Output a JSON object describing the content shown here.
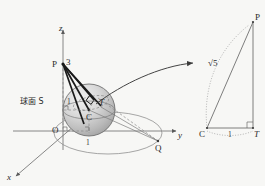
{
  "figure": {
    "background_color": "#f7f7f5",
    "ink_color": "#2b2b2b",
    "left_panel": {
      "caption": "球面 S",
      "axes": {
        "z_label": "z",
        "y_label": "y",
        "x_label": "x",
        "origin_label": "O"
      },
      "points": {
        "apex": "P",
        "center": "C",
        "tangent": "T",
        "circle_point": "Q"
      },
      "measures": {
        "apex_height": "3",
        "radius_left": "1",
        "base_unit": "1"
      }
    },
    "right_panel": {
      "points": {
        "top": "P",
        "bottom_left": "C",
        "bottom_right": "T"
      },
      "measures": {
        "hypotenuse": "√5",
        "base": "1"
      }
    }
  }
}
